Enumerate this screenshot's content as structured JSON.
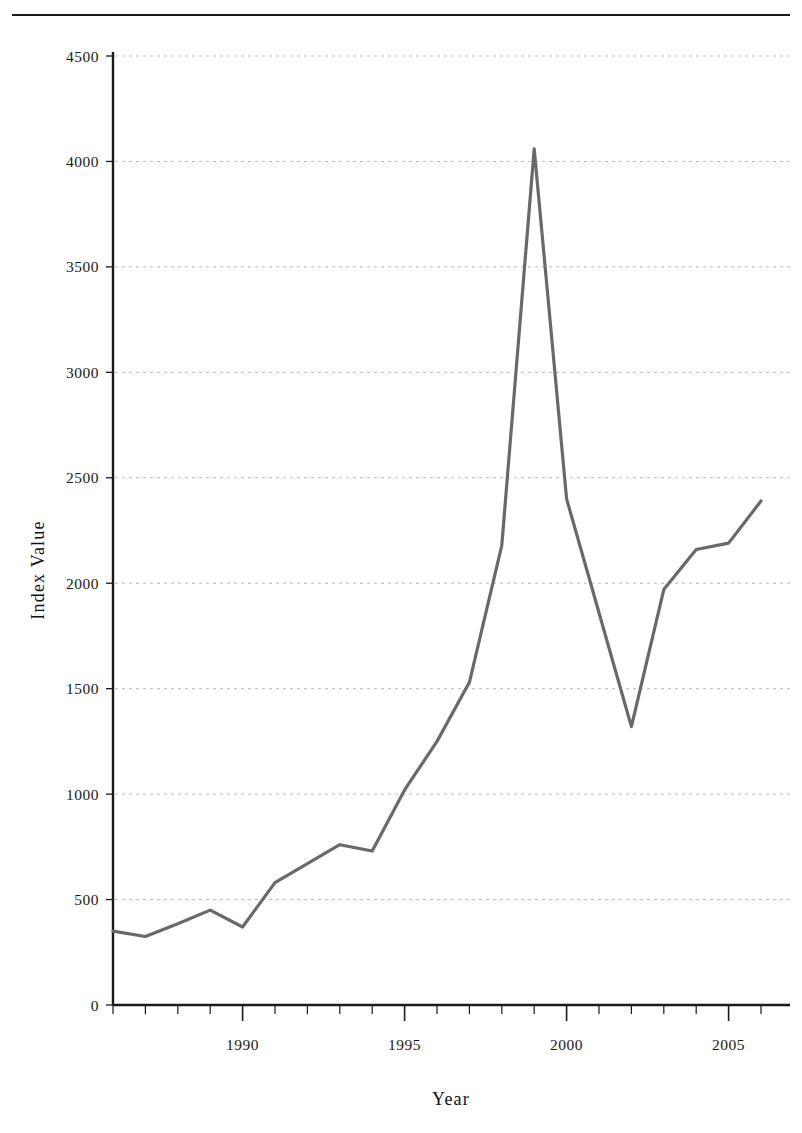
{
  "page": {
    "running_head": ""
  },
  "chart_data": {
    "type": "line",
    "title": "",
    "xlabel": "Year",
    "ylabel": "Index Value",
    "xlim": [
      1986,
      2006
    ],
    "ylim": [
      0,
      4500
    ],
    "grid": true,
    "legend": false,
    "line_color": "#696969",
    "axis_color": "#1a1a1a",
    "grid_color": "#b9b9b9",
    "x_tick_labels": [
      "1990",
      "1995",
      "2000",
      "2005"
    ],
    "x_tick_values": [
      1990,
      1995,
      2000,
      2005
    ],
    "x_minor_tick_step": 1,
    "y_tick_labels": [
      "0",
      "500",
      "1000",
      "1500",
      "2000",
      "2500",
      "3000",
      "3500",
      "4000",
      "4500"
    ],
    "y_tick_values": [
      0,
      500,
      1000,
      1500,
      2000,
      2500,
      3000,
      3500,
      4000,
      4500
    ],
    "x": [
      1986,
      1987,
      1988,
      1989,
      1990,
      1991,
      1992,
      1993,
      1994,
      1995,
      1996,
      1997,
      1998,
      1999,
      2000,
      2001,
      2002,
      2003,
      2004,
      2005,
      2006
    ],
    "values": [
      350,
      325,
      385,
      450,
      370,
      580,
      670,
      760,
      730,
      1020,
      1250,
      1530,
      2180,
      4060,
      2400,
      1860,
      1320,
      1970,
      2160,
      2190,
      2390
    ],
    "series": [
      {
        "name": "Index Value",
        "values": [
          350,
          325,
          385,
          450,
          370,
          580,
          670,
          760,
          730,
          1020,
          1250,
          1530,
          2180,
          4060,
          2400,
          1860,
          1320,
          1970,
          2160,
          2190,
          2390
        ]
      }
    ],
    "annotations": []
  },
  "axis_titles": {
    "x": "Year",
    "y": "Index Value"
  }
}
